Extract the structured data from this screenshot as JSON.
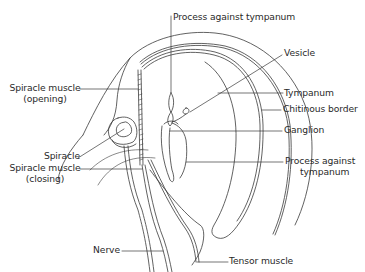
{
  "diagram": {
    "colors": {
      "line": "#3a3a3a",
      "background": "#ffffff",
      "text": "#2a2a2a"
    },
    "labels": {
      "process_top": "Process against tympanum",
      "vesicle": "Vesicle",
      "spiracle_muscle_opening_1": "Spiracle muscle",
      "spiracle_muscle_opening_2": "(opening)",
      "tympanum": "Tympanum",
      "chitinous_border": "Chitinous border",
      "ganglion": "Ganglion",
      "spiracle": "Spiracle",
      "spiracle_muscle_closing_1": "Spiracle muscle",
      "spiracle_muscle_closing_2": "(closing)",
      "process_bottom_1": "Process against",
      "process_bottom_2": "tympanum",
      "nerve": "Nerve",
      "tensor_muscle": "Tensor muscle"
    }
  }
}
